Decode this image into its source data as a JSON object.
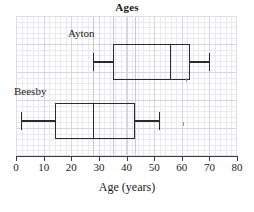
{
  "chart_data": {
    "type": "boxplot",
    "title": "Ages",
    "xlabel": "Age (years)",
    "ylabel": "",
    "xlim": [
      0,
      80
    ],
    "xticks": [
      0,
      10,
      20,
      30,
      40,
      50,
      60,
      70,
      80
    ],
    "xtick_labels": [
      "0",
      "10",
      "20",
      "30",
      "40",
      "50",
      "60",
      "70",
      "80"
    ],
    "grid": true,
    "legend": "none",
    "orientation": "horizontal",
    "series": [
      {
        "name": "Ayton",
        "min": 28,
        "q1": 35,
        "median": 56,
        "q3": 63,
        "max": 70
      },
      {
        "name": "Beesby",
        "min": 2,
        "q1": 14,
        "median": 28,
        "q3": 43,
        "max": 52
      }
    ]
  },
  "axis": {
    "title": "Age (years)",
    "ticks": [
      "0",
      "10",
      "20",
      "30",
      "40",
      "50",
      "60",
      "70",
      "80"
    ]
  },
  "header": {
    "title": "Ages"
  },
  "labels": {
    "ayton": "Ayton",
    "beesby": "Beesby"
  },
  "colors": {
    "ink": "#2b2b2b",
    "grid_minor": "#e9e9ef",
    "grid_major": "#d6d6e2",
    "background": "#ffffff"
  }
}
